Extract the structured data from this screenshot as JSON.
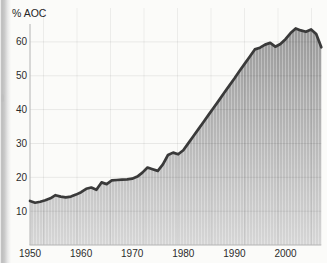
{
  "chart_data": {
    "type": "area",
    "title": "% AOC",
    "x": [
      1950,
      1951,
      1952,
      1953,
      1954,
      1955,
      1956,
      1957,
      1958,
      1959,
      1960,
      1961,
      1962,
      1963,
      1964,
      1965,
      1966,
      1967,
      1968,
      1969,
      1970,
      1971,
      1972,
      1973,
      1974,
      1975,
      1976,
      1977,
      1978,
      1979,
      1980,
      1981,
      1982,
      1983,
      1984,
      1985,
      1986,
      1987,
      1988,
      1989,
      1990,
      1991,
      1992,
      1993,
      1994,
      1995,
      1996,
      1997,
      1998,
      1999,
      2000,
      2001,
      2002,
      2003,
      2004,
      2005,
      2006,
      2007
    ],
    "series": [
      {
        "name": "% AOC",
        "values": [
          13.0,
          12.5,
          12.8,
          13.2,
          13.8,
          14.7,
          14.3,
          14.1,
          14.3,
          14.9,
          15.6,
          16.6,
          17.0,
          16.3,
          18.5,
          18.0,
          19.1,
          19.2,
          19.3,
          19.4,
          19.6,
          20.2,
          21.4,
          22.9,
          22.4,
          21.9,
          23.8,
          26.6,
          27.3,
          26.8,
          28.0,
          30.1,
          32.2,
          34.3,
          36.4,
          38.6,
          40.7,
          42.8,
          45.0,
          47.1,
          49.2,
          51.4,
          53.5,
          55.6,
          57.8,
          58.3,
          59.2,
          59.7,
          58.6,
          59.4,
          60.8,
          62.6,
          64.0,
          63.4,
          63.0,
          63.7,
          62.3,
          58.4
        ]
      }
    ],
    "xticks": [
      1950,
      1960,
      1970,
      1980,
      1990,
      2000
    ],
    "yticks": [
      10,
      20,
      30,
      40,
      50,
      60
    ],
    "xlim": [
      1950,
      2007
    ],
    "ylim": [
      0,
      65
    ],
    "grid": "on",
    "legend": "none",
    "xlabel": "",
    "ylabel": "% AOC",
    "colors": {
      "line": "#3a3a3a",
      "fill_top": "#999999",
      "fill_bottom": "#d6d6d6",
      "axis": "#b4b4b4",
      "gridline": "#e9e9e9",
      "tick_text": "#2b2b2b"
    }
  }
}
